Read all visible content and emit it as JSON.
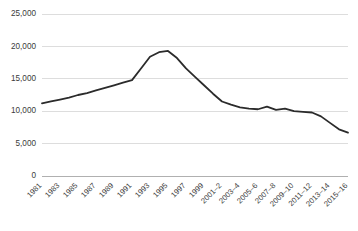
{
  "chart_data": {
    "type": "line",
    "title": "",
    "subtitle": "",
    "xlabel": "",
    "ylabel": "",
    "grid": true,
    "legend": false,
    "legend_position": "none",
    "line_color": "#2b2b2b",
    "grid_color": "#d9d9d9",
    "axis_color": "#b0b0b0",
    "ylim": [
      0,
      25000
    ],
    "ytick_values": [
      0,
      5000,
      10000,
      15000,
      20000,
      25000
    ],
    "ytick_labels": [
      "0",
      "5,000",
      "10,000",
      "15,000",
      "20,000",
      "25,000"
    ],
    "xtick_labels": [
      "1981",
      "1983",
      "1985",
      "1987",
      "1989",
      "1991",
      "1993",
      "1995",
      "1997",
      "1999",
      "2001–2",
      "2003–4",
      "2005–6",
      "2007–8",
      "2009–10",
      "2011–12",
      "2013–14",
      "2015–16"
    ],
    "categories": [
      "1981",
      "1982",
      "1983",
      "1984",
      "1985",
      "1986",
      "1987",
      "1988",
      "1989",
      "1990",
      "1991",
      "1992",
      "1993",
      "1994",
      "1995",
      "1996",
      "1997",
      "1998",
      "1999",
      "2000–1",
      "2001–2",
      "2002–3",
      "2003–4",
      "2004–5",
      "2005–6",
      "2006–7",
      "2007–8",
      "2008–9",
      "2009–10",
      "2010–11",
      "2011–12",
      "2012–13",
      "2013–14",
      "2014–15",
      "2015–16"
    ],
    "values": [
      11200,
      11500,
      11800,
      12100,
      12500,
      12800,
      13200,
      13600,
      14000,
      14400,
      14800,
      16600,
      18400,
      19100,
      19300,
      18200,
      16600,
      15300,
      14000,
      12700,
      11500,
      11000,
      10600,
      10400,
      10300,
      10700,
      10200,
      10400,
      10000,
      9900,
      9800,
      9200,
      8200,
      7200,
      6700
    ]
  }
}
